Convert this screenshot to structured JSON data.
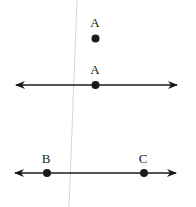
{
  "diagram": {
    "point": {
      "label": "A"
    },
    "line": {
      "point_label": "A"
    },
    "line_bc": {
      "left_label": "B",
      "right_label": "C"
    },
    "colors": {
      "ink": "#1a1a1a",
      "guide": "#d0d0d0",
      "background": "#ffffff"
    }
  }
}
